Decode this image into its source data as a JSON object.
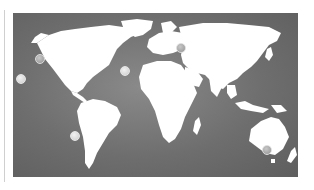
{
  "map": {
    "type": "world-map",
    "background_color": "#6e6e6e",
    "land_color": "#ffffff",
    "markers": [
      {
        "id": "marker-offmap-pacific",
        "region": "Pacific (outside map)",
        "x": 21,
        "y": 79,
        "style": "light"
      },
      {
        "id": "marker-us-west-coast",
        "region": "US West Coast",
        "x": 40,
        "y": 59,
        "style": "normal"
      },
      {
        "id": "marker-west-africa",
        "region": "West Africa coast",
        "x": 125,
        "y": 71,
        "style": "light"
      },
      {
        "id": "marker-caucasus",
        "region": "Caucasus / Caspian",
        "x": 181,
        "y": 48,
        "style": "normal"
      },
      {
        "id": "marker-chile",
        "region": "Chile coast",
        "x": 75,
        "y": 136,
        "style": "light"
      },
      {
        "id": "marker-se-australia",
        "region": "Southeast Australia",
        "x": 267,
        "y": 150,
        "style": "normal"
      }
    ]
  }
}
